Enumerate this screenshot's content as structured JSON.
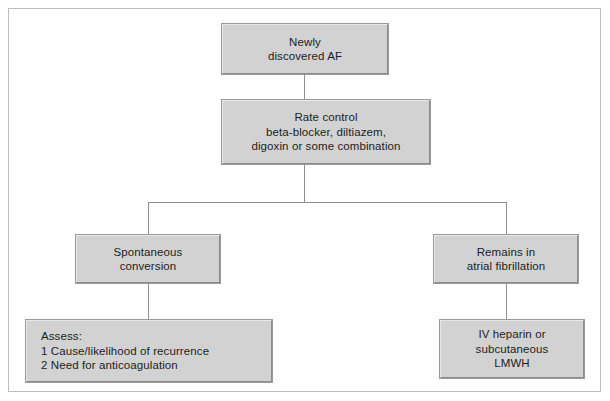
{
  "diagram": {
    "type": "flowchart",
    "orientation": "top-down",
    "colors": {
      "node_fill": "#d2d2d2",
      "node_border": "#9a9a9a",
      "connector": "#8f8f8f",
      "frame_border": "#bdbdbd",
      "text": "#1d1d1d",
      "background": "#ffffff"
    },
    "nodes": {
      "newly_discovered": {
        "id": "newly-discovered-af",
        "lines": [
          "Newly",
          "discovered AF"
        ],
        "align": "center"
      },
      "rate_control": {
        "id": "rate-control",
        "lines": [
          "Rate control",
          "beta-blocker, diltiazem,",
          "digoxin or some combination"
        ],
        "align": "center"
      },
      "spontaneous_conversion": {
        "id": "spontaneous-conversion",
        "lines": [
          "Spontaneous",
          "conversion"
        ],
        "align": "center"
      },
      "remains_in_af": {
        "id": "remains-in-atrial-fibrillation",
        "lines": [
          "Remains in",
          "atrial fibrillation"
        ],
        "align": "center"
      },
      "assess": {
        "id": "assess",
        "lines": [
          "Assess:",
          "1 Cause/likelihood of recurrence",
          "2 Need for anticoagulation"
        ],
        "align": "left"
      },
      "heparin": {
        "id": "iv-heparin-or-subcutaneous-lmwh",
        "lines": [
          "IV heparin or",
          "subcutaneous",
          "LMWH"
        ],
        "align": "center"
      }
    },
    "edges": [
      {
        "from": "newly-discovered-af",
        "to": "rate-control",
        "style": "straight-vertical"
      },
      {
        "from": "rate-control",
        "to": "spontaneous-conversion",
        "style": "split-horizontal-left"
      },
      {
        "from": "rate-control",
        "to": "remains-in-atrial-fibrillation",
        "style": "split-horizontal-right"
      },
      {
        "from": "spontaneous-conversion",
        "to": "assess",
        "style": "straight-vertical"
      },
      {
        "from": "remains-in-atrial-fibrillation",
        "to": "iv-heparin-or-subcutaneous-lmwh",
        "style": "straight-vertical"
      }
    ]
  }
}
